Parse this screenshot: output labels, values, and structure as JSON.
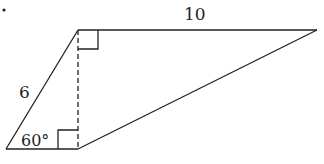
{
  "diagram": {
    "type": "trapezoid-with-height",
    "labels": {
      "top_side": "10",
      "left_side": "6",
      "angle": "60°"
    },
    "marks": [
      "right-angle-top",
      "right-angle-bottom",
      "dashed-height"
    ],
    "colors": {
      "stroke": "#222222",
      "background": "#ffffff"
    }
  }
}
